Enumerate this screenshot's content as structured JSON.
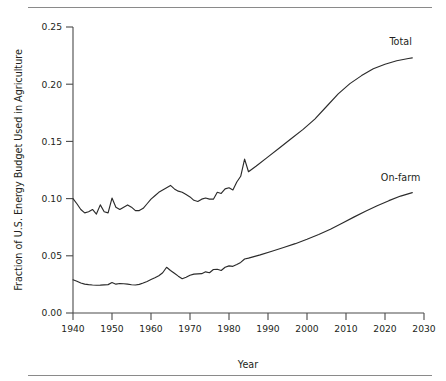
{
  "chart_data": {
    "type": "line",
    "title": "",
    "xlabel": "Year",
    "ylabel": "Fraction of U.S. Energy Budget Used in Agriculture",
    "xlim": [
      1940,
      2030
    ],
    "ylim": [
      0.0,
      0.25
    ],
    "xticks": [
      1940,
      1950,
      1960,
      1970,
      1980,
      1990,
      2000,
      2010,
      2020,
      2030
    ],
    "xtick_labels": [
      "1940",
      "1950",
      "1960",
      "1970",
      "1980",
      "1990",
      "2000",
      "2010",
      "2020",
      "2030"
    ],
    "yticks": [
      0.0,
      0.05,
      0.1,
      0.15,
      0.2,
      0.25
    ],
    "ytick_labels": [
      "0.00",
      "0.05",
      "0.10",
      "0.15",
      "0.20",
      "0.25"
    ],
    "grid": false,
    "legend_position": "inline-right-of-curve-ends",
    "line_color": "#2b2b2b",
    "series": [
      {
        "name": "Total",
        "label": "Total",
        "label_x": 2024,
        "label_y": 0.2345,
        "x": [
          1940,
          1941,
          1942,
          1943,
          1944,
          1945,
          1946,
          1947,
          1948,
          1949,
          1950,
          1951,
          1952,
          1953,
          1954,
          1955,
          1956,
          1957,
          1958,
          1959,
          1960,
          1961,
          1962,
          1963,
          1964,
          1965,
          1966,
          1967,
          1968,
          1969,
          1970,
          1971,
          1972,
          1973,
          1974,
          1975,
          1976,
          1977,
          1978,
          1979,
          1980,
          1981,
          1982,
          1983,
          1984,
          1985,
          1987,
          1990,
          1993,
          1996,
          1999,
          2002,
          2005,
          2008,
          2011,
          2014,
          2017,
          2020,
          2023,
          2026,
          2027
        ],
        "y": [
          0.1,
          0.0955,
          0.0905,
          0.0875,
          0.0885,
          0.0905,
          0.0865,
          0.0945,
          0.0885,
          0.0875,
          0.1005,
          0.0925,
          0.0905,
          0.0925,
          0.0945,
          0.0925,
          0.0895,
          0.0895,
          0.0915,
          0.0955,
          0.0995,
          0.1025,
          0.1055,
          0.1075,
          0.1095,
          0.1115,
          0.1085,
          0.1065,
          0.1055,
          0.1035,
          0.1015,
          0.0985,
          0.0975,
          0.0995,
          0.1005,
          0.0995,
          0.0995,
          0.1055,
          0.1045,
          0.1085,
          0.1095,
          0.1075,
          0.1145,
          0.1195,
          0.1345,
          0.1235,
          0.1285,
          0.1365,
          0.1445,
          0.1525,
          0.1605,
          0.1695,
          0.1805,
          0.1915,
          0.2005,
          0.2075,
          0.2135,
          0.2175,
          0.2205,
          0.2225,
          0.223
        ]
      },
      {
        "name": "On-farm",
        "label": "On-farm",
        "label_x": 2024,
        "label_y": 0.1155,
        "x": [
          1940,
          1941,
          1942,
          1943,
          1944,
          1945,
          1946,
          1947,
          1948,
          1949,
          1950,
          1951,
          1952,
          1953,
          1954,
          1955,
          1956,
          1957,
          1958,
          1959,
          1960,
          1961,
          1962,
          1963,
          1964,
          1965,
          1966,
          1967,
          1968,
          1969,
          1970,
          1971,
          1972,
          1973,
          1974,
          1975,
          1976,
          1977,
          1978,
          1979,
          1980,
          1981,
          1982,
          1983,
          1984,
          1985,
          1988,
          1991,
          1994,
          1997,
          2000,
          2003,
          2006,
          2009,
          2012,
          2015,
          2018,
          2021,
          2024,
          2027
        ],
        "y": [
          0.029,
          0.0278,
          0.0262,
          0.0252,
          0.0248,
          0.0245,
          0.0243,
          0.0244,
          0.0246,
          0.0248,
          0.0266,
          0.0252,
          0.0258,
          0.0256,
          0.0252,
          0.0247,
          0.0245,
          0.025,
          0.0262,
          0.0276,
          0.0292,
          0.0308,
          0.0326,
          0.0352,
          0.04,
          0.0372,
          0.0348,
          0.0322,
          0.03,
          0.0312,
          0.033,
          0.034,
          0.0342,
          0.0344,
          0.036,
          0.0352,
          0.038,
          0.0382,
          0.0372,
          0.04,
          0.0412,
          0.0408,
          0.0424,
          0.0442,
          0.0472,
          0.048,
          0.0508,
          0.054,
          0.0572,
          0.0606,
          0.0644,
          0.0686,
          0.0732,
          0.0784,
          0.0838,
          0.089,
          0.0938,
          0.0982,
          0.1022,
          0.1052
        ]
      }
    ]
  }
}
